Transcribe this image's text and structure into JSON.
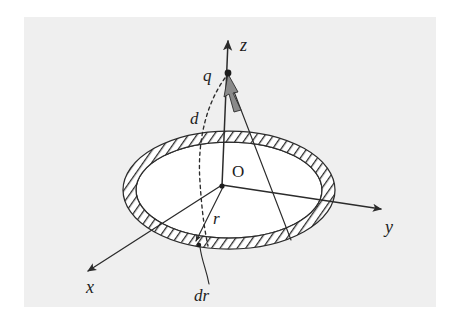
{
  "figure": {
    "caption": "",
    "background_color": "#ffffff",
    "plate_color": "#efefef",
    "ink_color": "#2b2b2b"
  },
  "labels": {
    "z_axis": "z",
    "y_axis": "y",
    "x_axis": "x",
    "origin": "O",
    "charge": "q",
    "distance": "d",
    "radius": "r",
    "ring_width": "dr"
  },
  "geometry": {
    "origin_point": {
      "x": 222,
      "y": 185
    },
    "charge_point": {
      "x": 228,
      "y": 74
    },
    "z_tip": {
      "x": 228,
      "y": 38
    },
    "y_tip": {
      "x": 381,
      "y": 208
    },
    "x_tip": {
      "x": 86,
      "y": 272
    },
    "disk_center": {
      "x": 229,
      "y": 190
    },
    "outer_rx": 106,
    "outer_ry": 59,
    "inner_rx": 93,
    "inner_ry": 48,
    "ring_touch_left": {
      "x": 195,
      "y": 243
    },
    "ring_touch_right": {
      "x": 291,
      "y": 240
    },
    "dr_leader_anchor": {
      "x": 201,
      "y": 248
    },
    "dr_label_pos": {
      "x": 208,
      "y": 296
    }
  },
  "elements": [
    {
      "name": "z-axis",
      "kind": "arrow",
      "description": "vertical axis from origin upward"
    },
    {
      "name": "y-axis",
      "kind": "arrow",
      "description": "axis toward lower right"
    },
    {
      "name": "x-axis",
      "kind": "arrow",
      "description": "axis toward lower left, out of page"
    },
    {
      "name": "charged-disk",
      "kind": "ellipse",
      "description": "disk in xy-plane seen in perspective"
    },
    {
      "name": "hatched-ring",
      "kind": "annulus",
      "description": "differential ring element of width dr"
    },
    {
      "name": "distance-curve",
      "kind": "dashed-arc",
      "description": "dashed arc labelled d from q to ring"
    },
    {
      "name": "radius-arrow",
      "kind": "arrow",
      "description": "arrow labelled r from origin to ring"
    },
    {
      "name": "field-arrow",
      "kind": "filled-arrow",
      "description": "shaded field arrow at the charge"
    }
  ]
}
